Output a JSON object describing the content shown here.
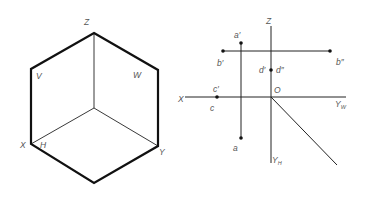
{
  "left_diagram": {
    "title": "Three projection planes (isometric view)",
    "labels": {
      "z": "Z",
      "v": "V",
      "w": "W",
      "x": "X",
      "h": "H",
      "y": "Y"
    },
    "vertices": {
      "top": [
        94,
        33
      ],
      "upper_left": [
        31,
        69
      ],
      "upper_right": [
        158,
        70
      ],
      "center": [
        94,
        108
      ],
      "lower_left": [
        31,
        144
      ],
      "lower_right": [
        158,
        146
      ],
      "bottom": [
        94,
        183
      ]
    },
    "outline_stroke": 2.2,
    "inner_stroke": 0.9
  },
  "right_diagram": {
    "title": "Orthographic projections of points and lines",
    "axis_labels": {
      "z": "Z",
      "x": "X",
      "origin": "O",
      "yw": "Y",
      "yw_sub": "W",
      "yh": "Y",
      "yh_sub": "H"
    },
    "point_labels": {
      "a_prime": "a′",
      "a": "a",
      "b_prime": "b′",
      "b_double_prime": "b″",
      "c_prime": "c′",
      "c": "c",
      "d_prime": "d′",
      "d_double_prime": "d″"
    },
    "origin": [
      271,
      97
    ],
    "points": {
      "a_prime": [
        241,
        43
      ],
      "a": [
        241,
        138
      ],
      "b_prime": [
        223,
        51
      ],
      "b_double_prime": [
        330,
        51
      ],
      "c_prime": [
        217,
        97
      ],
      "d": [
        271,
        70
      ]
    },
    "stroke_color": "#222222",
    "label_color": "#555555"
  }
}
